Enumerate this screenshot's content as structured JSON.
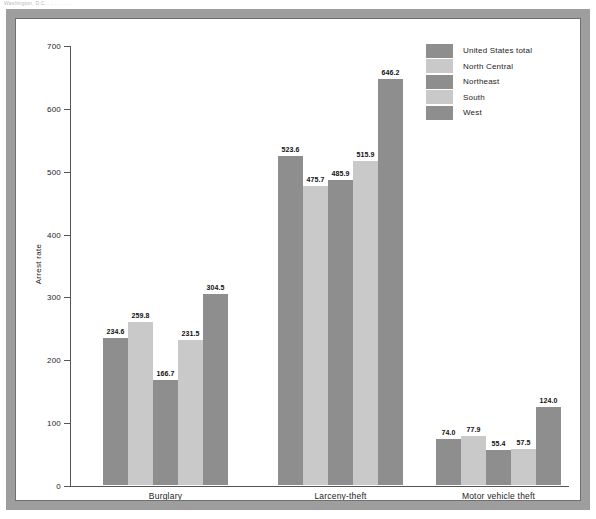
{
  "scan": {
    "top_edge_text": "Washington, D.C. . . . . . . . ."
  },
  "chart_data": {
    "type": "bar",
    "title": "",
    "subtitle": "",
    "xlabel": "",
    "ylabel": "Arrest rate",
    "ylim": [
      0,
      700
    ],
    "ytick_step": 100,
    "yticks": [
      0,
      100,
      200,
      300,
      400,
      500,
      600,
      700
    ],
    "ytick_labels": [
      "0",
      "100",
      "200",
      "300",
      "400",
      "500",
      "600",
      "700"
    ],
    "grid": false,
    "legend_position": "top-right",
    "categories": [
      "Burglary",
      "Larceny-theft",
      "Motor vehicle theft"
    ],
    "series": [
      {
        "name": "United States total",
        "color": "#8e8e8e",
        "values": [
          234.6,
          523.6,
          74.0
        ],
        "labels": [
          "234.6",
          "523.6",
          "74.0"
        ]
      },
      {
        "name": "North Central",
        "color": "#c9c9c9",
        "values": [
          259.8,
          475.7,
          77.9
        ],
        "labels": [
          "259.8",
          "475.7",
          "77.9"
        ]
      },
      {
        "name": "Northeast",
        "color": "#8e8e8e",
        "values": [
          166.7,
          485.9,
          55.4
        ],
        "labels": [
          "166.7",
          "485.9",
          "55.4"
        ]
      },
      {
        "name": "South",
        "color": "#c9c9c9",
        "values": [
          231.5,
          515.9,
          57.5
        ],
        "labels": [
          "231.5",
          "515.9",
          "57.5"
        ]
      },
      {
        "name": "West",
        "color": "#8e8e8e",
        "values": [
          304.5,
          646.2,
          124.0
        ],
        "labels": [
          "304.5",
          "646.2",
          "124.0"
        ]
      }
    ]
  },
  "legend": {
    "entries": [
      {
        "label": "United States total",
        "color": "#8e8e8e"
      },
      {
        "label": "North Central",
        "color": "#c9c9c9"
      },
      {
        "label": "Northeast",
        "color": "#8e8e8e"
      },
      {
        "label": "South",
        "color": "#c9c9c9"
      },
      {
        "label": "West",
        "color": "#8e8e8e"
      }
    ]
  }
}
